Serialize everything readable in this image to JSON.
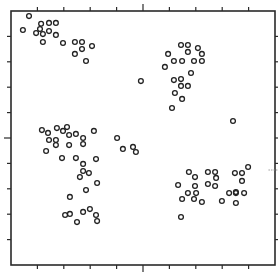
{
  "chart_data": {
    "type": "scatter",
    "title": "",
    "xlabel": "",
    "ylabel": "",
    "xlim": [
      0,
      10
    ],
    "ylim": [
      0,
      10
    ],
    "grid": false,
    "legend": null,
    "tick_labels": {
      "x": [],
      "y": []
    },
    "ticks": {
      "x_minor": [
        1,
        2,
        3,
        4,
        6,
        7,
        8,
        9
      ],
      "x_major": [
        5
      ],
      "y_minor": [
        1,
        2,
        3,
        4,
        6,
        7,
        8,
        9
      ],
      "y_major": [
        5
      ]
    },
    "frame": {
      "left_px": 11,
      "top_px": 11,
      "right_px": 275,
      "bottom_px": 265
    },
    "marker": {
      "shape": "open-circle",
      "radius_px": 2.4,
      "stroke": "#222222",
      "stroke_width": 1.3
    },
    "annotations": [
      {
        "text": "",
        "x": 9.6,
        "y": 3.74,
        "style": "small dash mark"
      }
    ],
    "series": [
      {
        "name": "points",
        "points": [
          [
            0.68,
            9.8
          ],
          [
            0.45,
            9.25
          ],
          [
            1.14,
            9.5
          ],
          [
            1.44,
            9.53
          ],
          [
            1.7,
            9.53
          ],
          [
            0.95,
            9.13
          ],
          [
            1.1,
            9.29
          ],
          [
            1.21,
            9.09
          ],
          [
            1.44,
            9.21
          ],
          [
            1.7,
            9.06
          ],
          [
            1.21,
            8.78
          ],
          [
            1.97,
            8.74
          ],
          [
            2.42,
            8.78
          ],
          [
            2.69,
            8.78
          ],
          [
            2.69,
            8.5
          ],
          [
            2.42,
            8.31
          ],
          [
            3.07,
            8.62
          ],
          [
            2.84,
            8.03
          ],
          [
            6.44,
            8.66
          ],
          [
            6.7,
            8.66
          ],
          [
            7.08,
            8.54
          ],
          [
            5.95,
            8.31
          ],
          [
            6.7,
            8.39
          ],
          [
            7.23,
            8.31
          ],
          [
            6.17,
            8.03
          ],
          [
            6.48,
            8.03
          ],
          [
            6.93,
            8.03
          ],
          [
            7.23,
            8.03
          ],
          [
            5.83,
            7.8
          ],
          [
            6.82,
            7.56
          ],
          [
            6.17,
            7.28
          ],
          [
            6.44,
            7.32
          ],
          [
            6.44,
            7.05
          ],
          [
            6.7,
            7.05
          ],
          [
            6.21,
            6.77
          ],
          [
            6.48,
            6.54
          ],
          [
            6.1,
            6.18
          ],
          [
            4.92,
            7.24
          ],
          [
            8.41,
            5.67
          ],
          [
            1.17,
            5.31
          ],
          [
            1.74,
            5.39
          ],
          [
            2.12,
            5.43
          ],
          [
            1.4,
            5.2
          ],
          [
            1.97,
            5.28
          ],
          [
            2.2,
            5.12
          ],
          [
            2.46,
            5.16
          ],
          [
            3.14,
            5.28
          ],
          [
            1.44,
            4.92
          ],
          [
            1.7,
            4.92
          ],
          [
            2.73,
            5.0
          ],
          [
            1.7,
            4.72
          ],
          [
            2.2,
            4.72
          ],
          [
            2.73,
            4.76
          ],
          [
            1.33,
            4.49
          ],
          [
            1.93,
            4.21
          ],
          [
            2.46,
            4.21
          ],
          [
            3.22,
            4.17
          ],
          [
            2.73,
            3.98
          ],
          [
            4.02,
            5.0
          ],
          [
            4.24,
            4.57
          ],
          [
            4.62,
            4.65
          ],
          [
            4.73,
            4.45
          ],
          [
            2.73,
            3.7
          ],
          [
            2.95,
            3.62
          ],
          [
            2.61,
            3.46
          ],
          [
            3.26,
            3.23
          ],
          [
            2.84,
            2.95
          ],
          [
            2.23,
            2.68
          ],
          [
            2.99,
            2.2
          ],
          [
            2.05,
            1.97
          ],
          [
            2.23,
            2.01
          ],
          [
            2.73,
            2.09
          ],
          [
            3.22,
            1.97
          ],
          [
            2.5,
            1.69
          ],
          [
            3.26,
            1.73
          ],
          [
            6.74,
            3.66
          ],
          [
            7.46,
            3.66
          ],
          [
            7.73,
            3.66
          ],
          [
            8.48,
            3.62
          ],
          [
            8.75,
            3.62
          ],
          [
            8.98,
            3.86
          ],
          [
            6.97,
            3.46
          ],
          [
            7.77,
            3.43
          ],
          [
            8.75,
            3.31
          ],
          [
            6.33,
            3.15
          ],
          [
            6.97,
            3.11
          ],
          [
            7.46,
            3.19
          ],
          [
            7.73,
            3.11
          ],
          [
            8.52,
            2.87
          ],
          [
            6.7,
            2.83
          ],
          [
            7.01,
            2.83
          ],
          [
            8.26,
            2.83
          ],
          [
            8.52,
            2.83
          ],
          [
            8.83,
            2.83
          ],
          [
            6.48,
            2.6
          ],
          [
            6.93,
            2.6
          ],
          [
            7.23,
            2.48
          ],
          [
            7.99,
            2.52
          ],
          [
            8.52,
            2.44
          ],
          [
            6.44,
            1.89
          ]
        ]
      }
    ]
  }
}
